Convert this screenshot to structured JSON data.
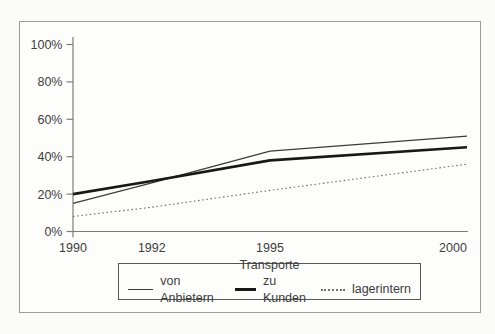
{
  "figure": {
    "background_color": "#fbfbfa",
    "frame_border_color": "#9b9b98",
    "axis_color": "#7d7d7a",
    "text_color": "#3d3d3b"
  },
  "chart_data": {
    "type": "line",
    "title": "",
    "x": [
      1990,
      1992,
      1995,
      2000
    ],
    "x_tick_labels": [
      "1990",
      "1992",
      "1995",
      "2000"
    ],
    "xlim": [
      1990,
      2000
    ],
    "y_ticks": [
      0,
      20,
      40,
      60,
      80,
      100
    ],
    "y_tick_labels": [
      "0%",
      "20%",
      "40%",
      "60%",
      "80%",
      "100%"
    ],
    "ylim": [
      0,
      100
    ],
    "grid": false,
    "series": [
      {
        "name": "von Anbietern",
        "style": "thin-solid",
        "color": "#3c3c3a",
        "values": [
          15,
          26,
          43,
          51
        ]
      },
      {
        "name": "zu Kunden",
        "style": "thick-solid",
        "color": "#181816",
        "values": [
          20,
          27,
          38,
          45
        ]
      },
      {
        "name": "lagerintern",
        "style": "dotted",
        "color": "#72726f",
        "values": [
          8,
          13,
          22,
          36
        ]
      }
    ],
    "legend": {
      "title": "Transporte",
      "position": "bottom"
    }
  }
}
